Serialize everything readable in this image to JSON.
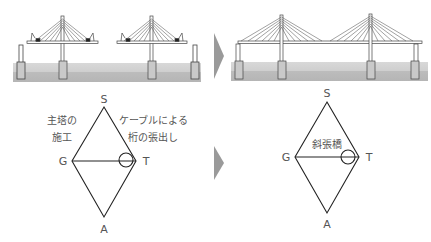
{
  "colors": {
    "water_top": "#d6d6d6",
    "water_bottom": "#bdbdbd",
    "arrow": "#9a9a9a",
    "line": "#333333",
    "label": "#555555"
  },
  "before": {
    "description": "cantilever construction of two cable-stayed towers",
    "diagram": {
      "vertex_top": "S",
      "vertex_left": "G",
      "vertex_right": "T",
      "vertex_bottom": "A",
      "note_left_line1": "主塔の",
      "note_left_line2": "施工",
      "note_right_line1": "ケーブルによる",
      "note_right_line2": "桁の張出し"
    }
  },
  "after": {
    "description": "completed two-tower cable-stayed bridge",
    "diagram": {
      "vertex_top": "S",
      "vertex_left": "G",
      "vertex_right": "T",
      "vertex_bottom": "A",
      "center_label": "斜張橋"
    }
  },
  "arrows": [
    "top-arrow",
    "bottom-arrow"
  ]
}
